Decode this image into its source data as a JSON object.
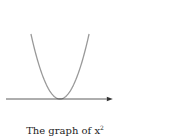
{
  "chart_data": {
    "type": "line",
    "function": "y = x^2",
    "xlabel": "x",
    "ylabel": "y",
    "x_ticks": [
      -3,
      -2,
      -1,
      0,
      1,
      2,
      3
    ],
    "y_ticks": [
      1,
      2,
      3,
      4,
      5
    ],
    "x_tick_labels": [
      "−3",
      "−2",
      "−1",
      "0",
      "1",
      "2",
      "3"
    ],
    "y_tick_labels": [
      "1",
      "2",
      "3",
      "4",
      "5"
    ],
    "xlim": [
      -3.5,
      3.5
    ],
    "ylim": [
      0,
      5.5
    ],
    "series": [
      {
        "name": "x^2",
        "x": [
          -2.24,
          -2,
          -1.5,
          -1,
          -0.5,
          0,
          0.5,
          1,
          1.5,
          2,
          2.24
        ],
        "values": [
          5,
          4,
          2.25,
          1,
          0.25,
          0,
          0.25,
          1,
          2.25,
          4,
          5
        ],
        "color": "#999999"
      }
    ],
    "grid": false,
    "legend": "none"
  },
  "caption": {
    "text": "The graph of x",
    "sup": "2"
  }
}
